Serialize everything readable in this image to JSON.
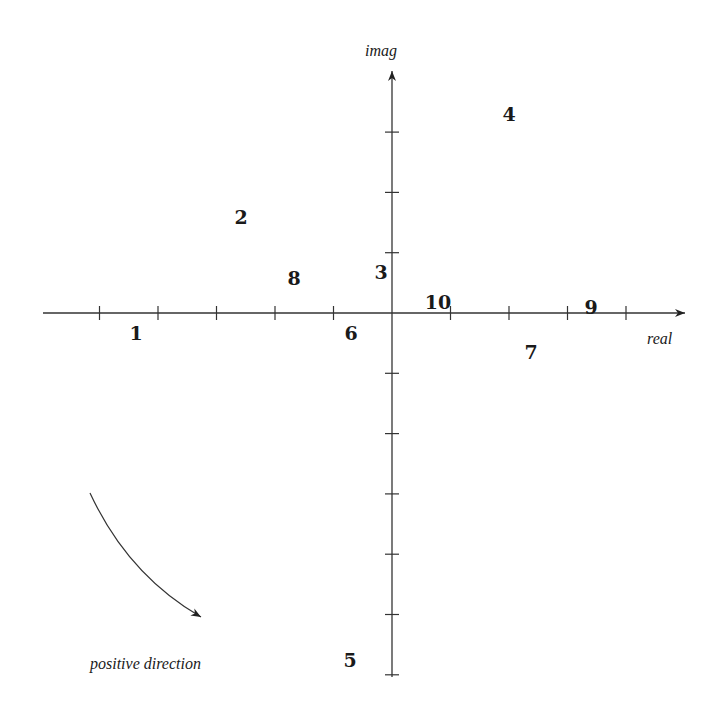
{
  "diagram": {
    "type": "complex-plane",
    "axes": {
      "x_label": "real",
      "y_label": "imag",
      "origin_px": [
        392,
        313
      ],
      "tick_spacing_px": 58.5,
      "x_ticks": [
        -5,
        -4,
        -3,
        -2,
        -1,
        1,
        2,
        3,
        4
      ],
      "y_ticks": [
        3,
        2,
        1,
        -1,
        -2,
        -3,
        -4,
        -5,
        -6
      ]
    },
    "points": [
      {
        "label": "1",
        "x": 136,
        "y": 333
      },
      {
        "label": "2",
        "x": 241,
        "y": 217
      },
      {
        "label": "3",
        "x": 381,
        "y": 272
      },
      {
        "label": "4",
        "x": 509,
        "y": 114
      },
      {
        "label": "5",
        "x": 350,
        "y": 660
      },
      {
        "label": "6",
        "x": 351,
        "y": 333
      },
      {
        "label": "7",
        "x": 531,
        "y": 352
      },
      {
        "label": "8",
        "x": 294,
        "y": 278
      },
      {
        "label": "9",
        "x": 591,
        "y": 307
      },
      {
        "label": "10",
        "x": 438,
        "y": 302
      }
    ],
    "direction_note": "positive direction"
  }
}
